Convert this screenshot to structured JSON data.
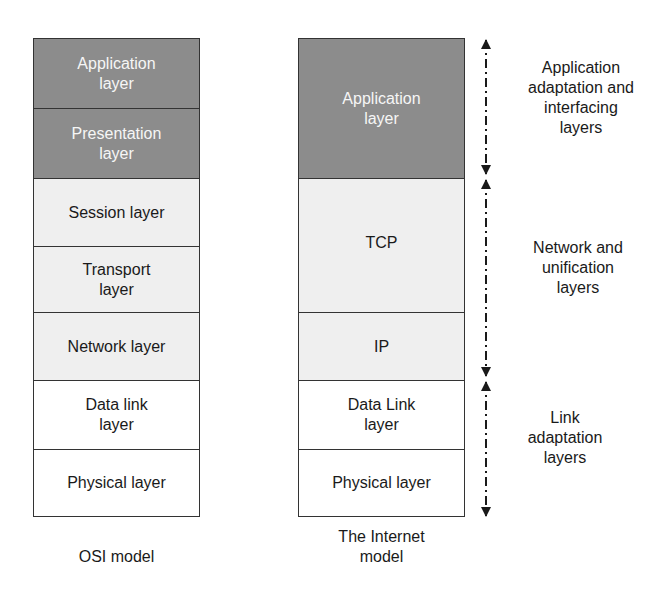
{
  "osi_model": {
    "caption": "OSI model",
    "layers": [
      {
        "label": "Application\nlayer",
        "shade": "dark"
      },
      {
        "label": "Presentation\nlayer",
        "shade": "dark"
      },
      {
        "label": "Session layer",
        "shade": "light"
      },
      {
        "label": "Transport\nlayer",
        "shade": "light"
      },
      {
        "label": "Network layer",
        "shade": "light"
      },
      {
        "label": "Data link\nlayer",
        "shade": "white"
      },
      {
        "label": "Physical layer",
        "shade": "white"
      }
    ]
  },
  "internet_model": {
    "caption": "The Internet\nmodel",
    "layers": [
      {
        "label": "Application\nlayer",
        "shade": "dark"
      },
      {
        "label": "TCP",
        "shade": "light"
      },
      {
        "label": "IP",
        "shade": "light"
      },
      {
        "label": "Data Link\nlayer",
        "shade": "white"
      },
      {
        "label": "Physical layer",
        "shade": "white"
      }
    ]
  },
  "groupings": [
    {
      "label": "Application\nadaptation and\ninterfacing\nlayers"
    },
    {
      "label": "Network and\nunification\nlayers"
    },
    {
      "label": "Link\nadaptation\nlayers"
    }
  ],
  "colors": {
    "dark": "#8c8c8c",
    "light": "#efefef",
    "white": "#ffffff",
    "border": "#333333"
  }
}
